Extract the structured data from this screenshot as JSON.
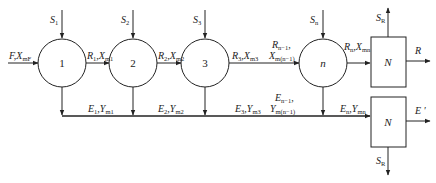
{
  "diagram": {
    "stages": [
      {
        "id": "stage-1",
        "label": "1",
        "solvent": "S",
        "solvent_sub": "1"
      },
      {
        "id": "stage-2",
        "label": "2",
        "solvent": "S",
        "solvent_sub": "2"
      },
      {
        "id": "stage-3",
        "label": "3",
        "solvent": "S",
        "solvent_sub": "3"
      },
      {
        "id": "stage-n",
        "label": "n",
        "solvent": "S",
        "solvent_sub": "n"
      }
    ],
    "feed": {
      "main": "F",
      "sep": ",",
      "var": "X",
      "sub": "mF"
    },
    "raffinate_streams": [
      {
        "main": "R",
        "main_sub": "1",
        "var": "X",
        "var_sub": "m1"
      },
      {
        "main": "R",
        "main_sub": "2",
        "var": "X",
        "var_sub": "m2"
      },
      {
        "main": "R",
        "main_sub": "3",
        "var": "X",
        "var_sub": "m3"
      },
      {
        "main": "R",
        "main_sub": "n−1",
        "var": "X",
        "var_sub": "m(n−1)"
      },
      {
        "main": "R",
        "main_sub": "n",
        "var": "X",
        "var_sub": "mn"
      }
    ],
    "extract_streams": [
      {
        "main": "E",
        "main_sub": "1",
        "var": "Y",
        "var_sub": "m1"
      },
      {
        "main": "E",
        "main_sub": "2",
        "var": "Y",
        "var_sub": "m2"
      },
      {
        "main": "E",
        "main_sub": "3",
        "var": "Y",
        "var_sub": "m3"
      },
      {
        "main": "E",
        "main_sub": "n−1",
        "var": "Y",
        "var_sub": "m(n−1)"
      },
      {
        "main": "E",
        "main_sub": "n",
        "var": "Y",
        "var_sub": "mn"
      }
    ],
    "recovery_units": [
      {
        "id": "recovery-raffinate",
        "label": "N",
        "solvent_out": "S",
        "solvent_out_sub": "R",
        "product": "R"
      },
      {
        "id": "recovery-extract",
        "label": "N",
        "solvent_out": "S",
        "solvent_out_sub": "R",
        "product": "E ′"
      }
    ]
  }
}
